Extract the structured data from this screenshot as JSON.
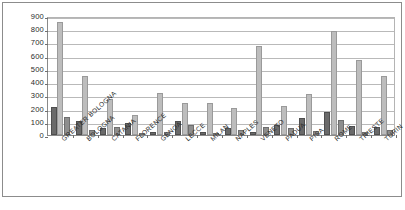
{
  "chart_data": {
    "type": "bar",
    "title": "",
    "xlabel": "",
    "ylabel": "",
    "ylim": [
      0,
      900
    ],
    "ytick_labels": [
      "900",
      "800",
      "700",
      "600",
      "500",
      "400",
      "300",
      "200",
      "100",
      "0"
    ],
    "ytick_values": [
      900,
      800,
      700,
      600,
      500,
      400,
      300,
      200,
      100,
      0
    ],
    "grid": true,
    "legend": "none",
    "categories": [
      "GREATER BOLOGNA",
      "BOLOGNA",
      "CATANIA",
      "FLORENCE",
      "GENOA",
      "LECCE",
      "MILAN",
      "NAPLES",
      "VENETO",
      "PADUA",
      "PISA",
      "ROME",
      "TRIESTE",
      "TURIN"
    ],
    "series": [
      {
        "name": "series-1",
        "color": "#6a6a6a",
        "values": [
          210,
          108,
          55,
          90,
          20,
          105,
          20,
          50,
          20,
          75,
          130,
          175,
          65,
          60
        ]
      },
      {
        "name": "series-2",
        "color": "#bdbdbd",
        "values": [
          855,
          445,
          272,
          155,
          315,
          245,
          240,
          205,
          675,
          222,
          310,
          785,
          570,
          450
        ]
      },
      {
        "name": "series-3",
        "color": "#8e8e8e",
        "values": [
          140,
          38,
          60,
          18,
          22,
          72,
          18,
          35,
          62,
          55,
          28,
          115,
          25,
          40
        ]
      }
    ]
  }
}
